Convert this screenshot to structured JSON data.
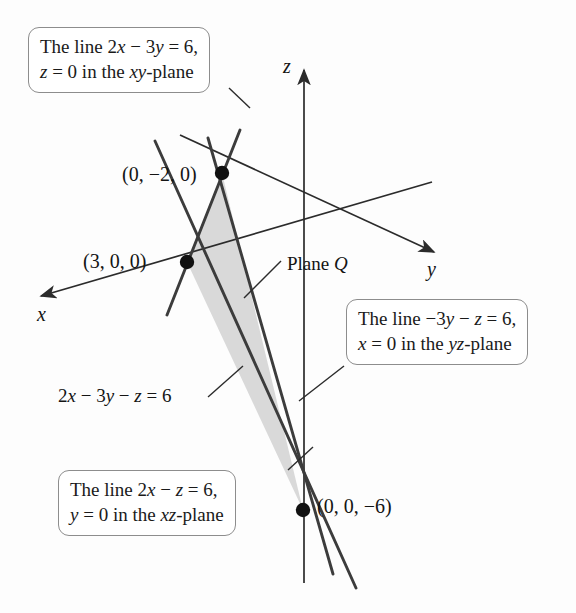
{
  "figure": {
    "plane_equation": "2x − 3y − z = 6",
    "plane_label": "Plane Q",
    "shade_color": "#d9d9d9",
    "line_color": "#3c3c3c",
    "axis_color": "#2b2b2b"
  },
  "axes": {
    "x_label": "x",
    "y_label": "y",
    "z_label": "z"
  },
  "points": [
    {
      "id": "point-0-neg2-0",
      "label": "(0, −2, 0)"
    },
    {
      "id": "point-3-0-0",
      "label": "(3, 0, 0)"
    },
    {
      "id": "point-0-0-neg6",
      "label": "(0, 0, −6)"
    }
  ],
  "callouts": [
    {
      "id": "callout-xy-trace",
      "line1": "The line 2x − 3y = 6,",
      "line2": "z = 0 in the xy-plane",
      "line1_parts": [
        {
          "t": "The line 2",
          "i": false
        },
        {
          "t": "x",
          "i": true
        },
        {
          "t": " − 3",
          "i": false
        },
        {
          "t": "y",
          "i": true
        },
        {
          "t": " = 6,",
          "i": false
        }
      ],
      "line2_parts": [
        {
          "t": "z",
          "i": true
        },
        {
          "t": " = 0 in the ",
          "i": false
        },
        {
          "t": "xy",
          "i": true
        },
        {
          "t": "-plane",
          "i": false
        }
      ]
    },
    {
      "id": "callout-yz-trace",
      "line1": "The line −3y − z = 6,",
      "line2": "x = 0 in the yz-plane",
      "line1_parts": [
        {
          "t": "The line −3",
          "i": false
        },
        {
          "t": "y",
          "i": true
        },
        {
          "t": " − ",
          "i": false
        },
        {
          "t": "z",
          "i": true
        },
        {
          "t": " = 6,",
          "i": false
        }
      ],
      "line2_parts": [
        {
          "t": "x",
          "i": true
        },
        {
          "t": " = 0 in the ",
          "i": false
        },
        {
          "t": "yz",
          "i": true
        },
        {
          "t": "-plane",
          "i": false
        }
      ]
    },
    {
      "id": "callout-xz-trace",
      "line1": "The line 2x − z = 6,",
      "line2": "y = 0 in the xz-plane",
      "line1_parts": [
        {
          "t": "The line 2",
          "i": false
        },
        {
          "t": "x",
          "i": true
        },
        {
          "t": " − ",
          "i": false
        },
        {
          "t": "z",
          "i": true
        },
        {
          "t": " = 6,",
          "i": false
        }
      ],
      "line2_parts": [
        {
          "t": "y",
          "i": true
        },
        {
          "t": " = 0 in the ",
          "i": false
        },
        {
          "t": "xz",
          "i": true
        },
        {
          "t": "-plane",
          "i": false
        }
      ]
    }
  ],
  "equation_label": {
    "id": "plane-equation-label",
    "parts": [
      {
        "t": "2",
        "i": false
      },
      {
        "t": "x",
        "i": true
      },
      {
        "t": " − 3",
        "i": false
      },
      {
        "t": "y",
        "i": true
      },
      {
        "t": " − ",
        "i": false
      },
      {
        "t": "z",
        "i": true
      },
      {
        "t": " = 6",
        "i": false
      }
    ],
    "text": "2x − 3y − z = 6"
  },
  "plane_q_label": {
    "id": "plane-q-label",
    "parts": [
      {
        "t": "Plane ",
        "i": false
      },
      {
        "t": "Q",
        "i": true
      }
    ],
    "text": "Plane Q"
  }
}
